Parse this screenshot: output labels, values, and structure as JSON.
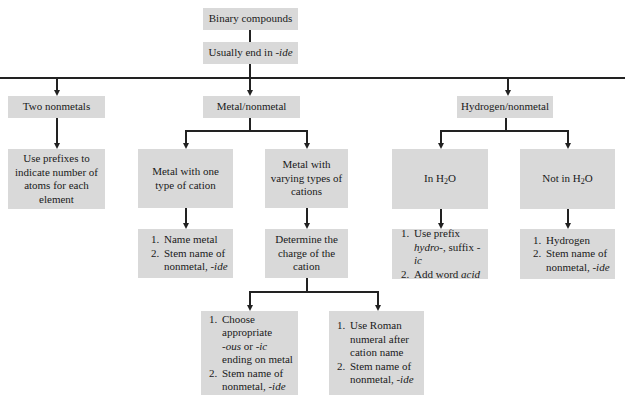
{
  "root": {
    "title": "Binary compounds",
    "subtitle_prefix": "Usually end in ",
    "subtitle_suffix": "-ide"
  },
  "categories": [
    {
      "label": "Two nonmetals",
      "rule": "Use prefixes to indicate number of atoms for each element"
    },
    {
      "label": "Metal/nonmetal"
    },
    {
      "label": "Hydrogen/nonmetal"
    }
  ],
  "metal": {
    "one_type": {
      "label": "Metal with one type of cation",
      "steps": [
        "Name metal",
        "Stem name of nonmetal, ",
        "-ide"
      ]
    },
    "varying": {
      "label": "Metal with varying types of cations",
      "determine": "Determine the charge of the cation"
    },
    "option_a": {
      "s1a": "Choose appropriate",
      "s1b": "-ous",
      "s1c": " or ",
      "s1d": "-ic",
      "s1e": "ending on metal",
      "s2": "Stem name of nonmetal, ",
      "s2i": "-ide"
    },
    "option_b": {
      "s1": "Use Roman numeral after cation name",
      "s2": "Stem name of nonmetal, ",
      "s2i": "-ide"
    }
  },
  "hydrogen": {
    "in_water": {
      "label_a": "In H",
      "sub": "2",
      "label_b": "O",
      "s1a": "Use prefix",
      "s1b": "hydro-",
      "s1c": ", suffix ",
      "s1d": "-ic",
      "s2a": "Add word ",
      "s2b": "acid"
    },
    "not_water": {
      "label_a": "Not in H",
      "sub": "2",
      "label_b": "O",
      "s1": "Hydrogen",
      "s2": "Stem name of nonmetal, ",
      "s2i": "-ide"
    }
  },
  "colors": {
    "box": "#d9d9d9",
    "line": "#222222"
  }
}
